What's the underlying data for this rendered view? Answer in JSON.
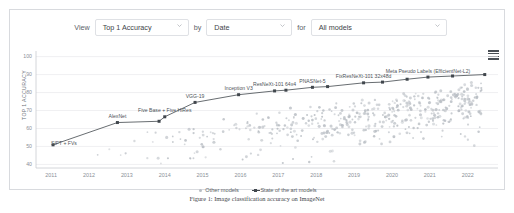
{
  "controls": {
    "view_label": "View",
    "by_label": "by",
    "for_label": "for",
    "metric_value": "Top 1 Accuracy",
    "by_value": "Date",
    "models_value": "All models",
    "caret_icon": "chevron-down-icon",
    "menu_icon": "hamburger-menu-icon"
  },
  "legend": {
    "other_label": "Other models",
    "sota_label": "State of the art models"
  },
  "caption": {
    "text": "Figure 1: Image classification accuracy on ImageNet"
  },
  "chart_data": {
    "type": "scatter",
    "title": "",
    "xlabel": "",
    "ylabel": "TOP 1 ACCURACY",
    "xlim": [
      2010.6,
      2022.8
    ],
    "ylim": [
      38,
      102
    ],
    "xticks": [
      "2011",
      "2012",
      "2013",
      "2014",
      "2015",
      "2016",
      "2017",
      "2018",
      "2019",
      "2020",
      "2021",
      "2022"
    ],
    "yticks": [
      100,
      90,
      80,
      70,
      60,
      50,
      40
    ],
    "grid": true,
    "legend_position": "bottom-center",
    "series": [
      {
        "name": "State of the art models",
        "color": "#41474d",
        "points": [
          {
            "x": 2011.05,
            "y": 50.9,
            "label": "SIFT + FVs",
            "label_pos": "left"
          },
          {
            "x": 2012.75,
            "y": 63.3,
            "label": "AlexNet",
            "label_pos": "top"
          },
          {
            "x": 2013.85,
            "y": 64.0,
            "label": "",
            "label_pos": "none"
          },
          {
            "x": 2014.0,
            "y": 66.5,
            "label": "Five Base + Five HiRes",
            "label_pos": "top"
          },
          {
            "x": 2014.8,
            "y": 74.5,
            "label": "VGG-19",
            "label_pos": "top"
          },
          {
            "x": 2015.95,
            "y": 78.8,
            "label": "Inception V3",
            "label_pos": "top"
          },
          {
            "x": 2016.9,
            "y": 80.9,
            "label": "ResNeXt-101 64x4",
            "label_pos": "top"
          },
          {
            "x": 2017.2,
            "y": 81.3,
            "label": "",
            "label_pos": "none"
          },
          {
            "x": 2017.9,
            "y": 82.9,
            "label": "PNASNet-5",
            "label_pos": "top"
          },
          {
            "x": 2018.3,
            "y": 83.3,
            "label": "",
            "label_pos": "none"
          },
          {
            "x": 2019.25,
            "y": 85.4,
            "label": "FixResNeXt-101 32x48d",
            "label_pos": "top"
          },
          {
            "x": 2019.75,
            "y": 85.8,
            "label": "",
            "label_pos": "none"
          },
          {
            "x": 2020.4,
            "y": 87.4,
            "label": "",
            "label_pos": "none"
          },
          {
            "x": 2020.95,
            "y": 88.6,
            "label": "Meta Pseudo Labels (EfficientNet-L2)",
            "label_pos": "top"
          },
          {
            "x": 2021.6,
            "y": 89.2,
            "label": "",
            "label_pos": "none"
          },
          {
            "x": 2022.45,
            "y": 90.0,
            "label": "",
            "label_pos": "none"
          }
        ]
      },
      {
        "name": "Other models",
        "color": "#b9bec4",
        "note": "dense cloud of ~450 grey points concentrated between 2017 and 2022, accuracy mostly 70-89, with a thin tail down to ~55"
      }
    ]
  }
}
